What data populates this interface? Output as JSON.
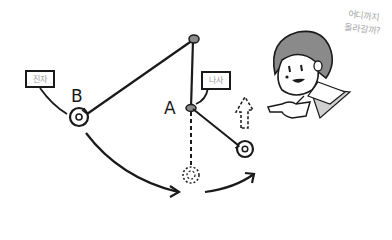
{
  "diagram": {
    "points": {
      "pivot": {
        "label": ""
      },
      "A": {
        "label": "A"
      },
      "B": {
        "label": "B"
      }
    },
    "tags": {
      "pendulum": "진자",
      "nail": "나사"
    },
    "speech": {
      "line1": "어디까지",
      "line2": "올라갈까?"
    },
    "colors": {
      "ink": "#1a1a1a",
      "hair": "#7a7a7a",
      "speech_text": "#a8a8a8",
      "shade": "#c8c8c8"
    }
  }
}
